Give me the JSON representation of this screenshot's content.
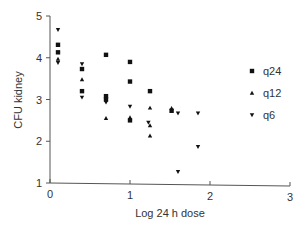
{
  "chart_data": {
    "type": "scatter",
    "title": "",
    "xlabel": "Log 24 h dose",
    "ylabel": "CFU kidney",
    "xlim": [
      0,
      3
    ],
    "ylim": [
      1,
      5
    ],
    "xticks": [
      "0",
      "1",
      "2",
      "3"
    ],
    "yticks": [
      "1",
      "2",
      "3",
      "4",
      "5"
    ],
    "grid": false,
    "legend_position": "right",
    "series": [
      {
        "name": "q24",
        "marker": "square",
        "color": "#111111",
        "points": [
          [
            0.1,
            4.31
          ],
          [
            0.1,
            4.13
          ],
          [
            0.4,
            3.73
          ],
          [
            0.4,
            3.2
          ],
          [
            0.7,
            4.07
          ],
          [
            0.7,
            3.08
          ],
          [
            0.7,
            3.0
          ],
          [
            1.0,
            3.9
          ],
          [
            1.0,
            3.43
          ],
          [
            1.0,
            2.5
          ],
          [
            1.25,
            3.2
          ],
          [
            1.52,
            2.73
          ]
        ]
      },
      {
        "name": "q12",
        "marker": "triangle-up",
        "color": "#111111",
        "points": [
          [
            0.1,
            3.97
          ],
          [
            0.4,
            3.48
          ],
          [
            0.7,
            2.55
          ],
          [
            1.0,
            2.57
          ],
          [
            1.25,
            2.8
          ],
          [
            1.25,
            2.38
          ],
          [
            1.25,
            2.13
          ],
          [
            1.52,
            2.79
          ]
        ]
      },
      {
        "name": "q6",
        "marker": "triangle-down",
        "color": "#111111",
        "points": [
          [
            0.1,
            4.67
          ],
          [
            0.1,
            3.88
          ],
          [
            0.4,
            3.85
          ],
          [
            0.4,
            3.05
          ],
          [
            0.7,
            2.93
          ],
          [
            1.0,
            2.83
          ],
          [
            1.23,
            2.45
          ],
          [
            1.6,
            2.67
          ],
          [
            1.6,
            1.27
          ],
          [
            1.85,
            2.67
          ],
          [
            1.85,
            1.87
          ]
        ]
      }
    ]
  }
}
